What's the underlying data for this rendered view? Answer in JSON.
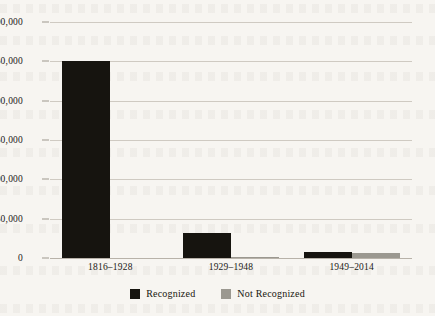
{
  "chart_data": {
    "type": "bar",
    "title": "",
    "xlabel": "",
    "ylabel": "",
    "categories": [
      "1816–1928",
      "1929–1948",
      "1949–2014"
    ],
    "series": [
      {
        "name": "Recognized",
        "color": "#16140f",
        "values": [
          251000,
          32000,
          8000
        ]
      },
      {
        "name": "Not Recognized",
        "color": "#9b9890",
        "values": [
          0,
          1000,
          6000
        ]
      }
    ],
    "ylim": [
      0,
      300000
    ],
    "yticks": [
      0,
      50000,
      100000,
      150000,
      200000,
      250000,
      300000
    ],
    "ytick_labels": [
      "0",
      "50,000",
      "100,000",
      "150,000",
      "200,000",
      "250,000",
      "300,000"
    ],
    "grid": true,
    "legend_position": "bottom"
  },
  "legend": {
    "items": [
      {
        "label": "Recognized",
        "swatch": "recognized"
      },
      {
        "label": "Not Recognized",
        "swatch": "notrecognized"
      }
    ]
  }
}
